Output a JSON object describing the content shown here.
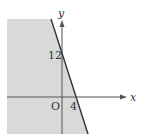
{
  "diagram": {
    "type": "inequality-region",
    "axes": {
      "x_label": "x",
      "y_label": "y",
      "origin_label": "O"
    },
    "line": {
      "y_intercept_label": "12",
      "x_intercept_label": "4"
    },
    "shaded_region": "below-left of line",
    "colors": {
      "shade": "#d6d6d6",
      "line": "#333333",
      "axis": "#555555"
    }
  }
}
